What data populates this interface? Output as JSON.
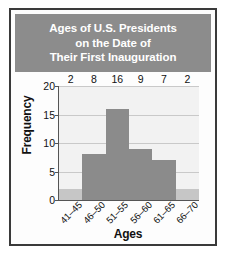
{
  "title_lines": [
    "Ages of U.S. Presidents",
    "on the Date of",
    "Their First Inauguration"
  ],
  "colors": {
    "title_band": "#8c8c8c",
    "title_text": "#ffffff",
    "bar_dark": "#8b8b8b",
    "bar_light": "#c6c6c6",
    "plot_background": "#f2f2f2",
    "gridline": "#c9c9c9",
    "axis": "#555555",
    "frame_border": "#3a3a3a"
  },
  "chart_data": {
    "type": "bar",
    "title": "Ages of U.S. Presidents on the Date of Their First Inauguration",
    "xlabel": "Ages",
    "ylabel": "Frequency",
    "categories": [
      "41–45",
      "46–50",
      "51–55",
      "56–60",
      "61–65",
      "66–70"
    ],
    "values": [
      2,
      8,
      16,
      9,
      7,
      2
    ],
    "bar_shades": [
      "light",
      "dark",
      "dark",
      "dark",
      "dark",
      "light"
    ],
    "ylim": [
      0,
      20
    ],
    "yticks": [
      0,
      5,
      10,
      15,
      20
    ],
    "ytick_labels": [
      "0",
      "5",
      "10",
      "15",
      "20"
    ],
    "grid": "horizontal",
    "legend": "none",
    "data_labels": [
      "2",
      "8",
      "16",
      "9",
      "7",
      "2"
    ]
  }
}
